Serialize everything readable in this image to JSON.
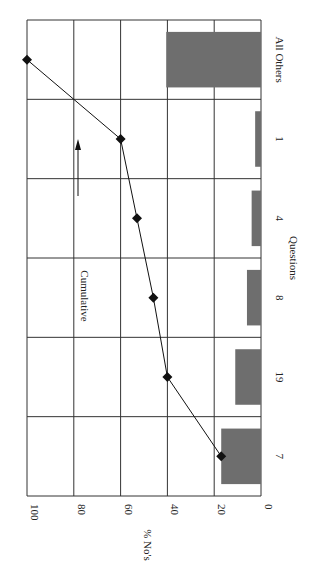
{
  "chart_data": {
    "type": "bar",
    "orientation": "rotated 90° clockwise (value axis runs right-to-left along the top-to-bottom page)",
    "title": "",
    "xlabel": "Questions",
    "ylabel": "% No's",
    "ylim": [
      0,
      100
    ],
    "yticks": [
      0,
      20,
      40,
      60,
      80,
      100
    ],
    "categories": [
      "7",
      "19",
      "8",
      "4",
      "1",
      "All Others"
    ],
    "series": [
      {
        "name": "% No's",
        "type": "bar",
        "values": [
          17,
          11,
          6,
          4,
          2.5,
          40.5
        ],
        "color": "#6e6e6e"
      },
      {
        "name": "Cumulative",
        "type": "line",
        "values": [
          17,
          40,
          46,
          53,
          60,
          100
        ],
        "marker": "diamond",
        "color": "#111111"
      }
    ],
    "annotations": [
      {
        "text": "Cumulative",
        "arrow": true
      }
    ],
    "grid": true,
    "legend": "none"
  }
}
